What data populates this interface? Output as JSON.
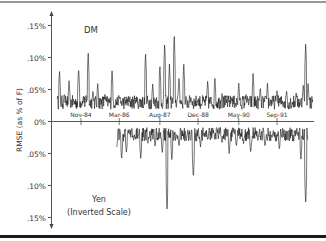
{
  "chart_data": {
    "type": "line",
    "title": "",
    "ylabel": "RMSE (as % of F)",
    "xlabel": "",
    "ylim": [
      -0.15,
      0.15
    ],
    "y_ticks": [
      {
        "value": 0.15,
        "label": ".15%"
      },
      {
        "value": 0.1,
        "label": ".10%"
      },
      {
        "value": 0.05,
        "label": ".05%"
      },
      {
        "value": 0.0,
        "label": "0%"
      },
      {
        "value": -0.05,
        "label": ".05%"
      },
      {
        "value": -0.1,
        "label": ".10%"
      },
      {
        "value": -0.15,
        "label": ".15%"
      }
    ],
    "x_ticks": [
      "Nov-84",
      "Mar-86",
      "Aug-87",
      "Dec-88",
      "May-90",
      "Sep-91"
    ],
    "grid": false,
    "legend": "none",
    "annotations": [
      {
        "text": "DM",
        "position": "upper panel, top-left"
      },
      {
        "text": "Yen",
        "position": "lower panel, bottom-left"
      },
      {
        "text": "(Inverted Scale)",
        "position": "lower panel, below Yen"
      }
    ],
    "series": [
      {
        "name": "DM",
        "scale": "normal",
        "start": "approx Jan-84",
        "end": "approx Dec-92",
        "typical_level": 0.03,
        "points": [
          {
            "x": "Jan-84",
            "y": 0.035
          },
          {
            "x": "Feb-84",
            "y": 0.08
          },
          {
            "x": "Apr-84",
            "y": 0.045
          },
          {
            "x": "Jun-84",
            "y": 0.065
          },
          {
            "x": "Aug-84",
            "y": 0.03
          },
          {
            "x": "Oct-84",
            "y": 0.085
          },
          {
            "x": "Dec-84",
            "y": 0.04
          },
          {
            "x": "Feb-85",
            "y": 0.11
          },
          {
            "x": "Apr-85",
            "y": 0.05
          },
          {
            "x": "Jun-85",
            "y": 0.06
          },
          {
            "x": "Sep-85",
            "y": 0.045
          },
          {
            "x": "Dec-85",
            "y": 0.08
          },
          {
            "x": "Mar-86",
            "y": 0.04
          },
          {
            "x": "Jun-86",
            "y": 0.03
          },
          {
            "x": "Oct-86",
            "y": 0.035
          },
          {
            "x": "Feb-87",
            "y": 0.11
          },
          {
            "x": "May-87",
            "y": 0.06
          },
          {
            "x": "Aug-87",
            "y": 0.09
          },
          {
            "x": "Oct-87",
            "y": 0.125
          },
          {
            "x": "Dec-87",
            "y": 0.09
          },
          {
            "x": "Feb-88",
            "y": 0.14
          },
          {
            "x": "Apr-88",
            "y": 0.07
          },
          {
            "x": "Jun-88",
            "y": 0.09
          },
          {
            "x": "Sep-88",
            "y": 0.04
          },
          {
            "x": "Dec-88",
            "y": 0.035
          },
          {
            "x": "Apr-89",
            "y": 0.065
          },
          {
            "x": "Jul-89",
            "y": 0.07
          },
          {
            "x": "Oct-89",
            "y": 0.045
          },
          {
            "x": "Feb-90",
            "y": 0.04
          },
          {
            "x": "May-90",
            "y": 0.06
          },
          {
            "x": "Aug-90",
            "y": 0.045
          },
          {
            "x": "Nov-90",
            "y": 0.075
          },
          {
            "x": "Feb-91",
            "y": 0.055
          },
          {
            "x": "May-91",
            "y": 0.06
          },
          {
            "x": "Sep-91",
            "y": 0.05
          },
          {
            "x": "Jan-92",
            "y": 0.05
          },
          {
            "x": "May-92",
            "y": 0.045
          },
          {
            "x": "Aug-92",
            "y": 0.06
          },
          {
            "x": "Sep-92",
            "y": 0.125
          },
          {
            "x": "Oct-92",
            "y": 0.06
          },
          {
            "x": "Dec-92",
            "y": 0.035
          }
        ]
      },
      {
        "name": "Yen",
        "scale": "inverted",
        "start": "approx Feb-86",
        "end": "approx Oct-92",
        "typical_level": 0.02,
        "points": [
          {
            "x": "Feb-86",
            "y": 0.04
          },
          {
            "x": "Apr-86",
            "y": 0.06
          },
          {
            "x": "Jun-86",
            "y": 0.05
          },
          {
            "x": "Sep-86",
            "y": 0.03
          },
          {
            "x": "Dec-86",
            "y": 0.06
          },
          {
            "x": "Mar-87",
            "y": 0.035
          },
          {
            "x": "Jun-87",
            "y": 0.04
          },
          {
            "x": "Sep-87",
            "y": 0.05
          },
          {
            "x": "Nov-87",
            "y": 0.145
          },
          {
            "x": "Jan-88",
            "y": 0.06
          },
          {
            "x": "Apr-88",
            "y": 0.04
          },
          {
            "x": "Jul-88",
            "y": 0.03
          },
          {
            "x": "Oct-88",
            "y": 0.09
          },
          {
            "x": "Jan-89",
            "y": 0.04
          },
          {
            "x": "Apr-89",
            "y": 0.03
          },
          {
            "x": "Jul-89",
            "y": 0.025
          },
          {
            "x": "Oct-89",
            "y": 0.035
          },
          {
            "x": "Jan-90",
            "y": 0.05
          },
          {
            "x": "Apr-90",
            "y": 0.04
          },
          {
            "x": "Jul-90",
            "y": 0.035
          },
          {
            "x": "Oct-90",
            "y": 0.05
          },
          {
            "x": "Jan-91",
            "y": 0.03
          },
          {
            "x": "Apr-91",
            "y": 0.04
          },
          {
            "x": "Jul-91",
            "y": 0.025
          },
          {
            "x": "Oct-91",
            "y": 0.045
          },
          {
            "x": "Jan-92",
            "y": 0.01
          },
          {
            "x": "Apr-92",
            "y": 0.02
          },
          {
            "x": "Jul-92",
            "y": 0.06
          },
          {
            "x": "Sep-92",
            "y": 0.135
          },
          {
            "x": "Oct-92",
            "y": 0.03
          }
        ]
      }
    ]
  },
  "labels": {
    "y_axis_title": "RMSE (as % of F)",
    "dm": "DM",
    "yen": "Yen",
    "inverted": "(Inverted Scale)",
    "y_ticks": [
      ".15%",
      ".10%",
      ".05%",
      "0%",
      ".05%",
      ".10%",
      ".15%"
    ],
    "x_ticks": [
      "Nov-84",
      "Mar-86",
      "Aug-87",
      "Dec-88",
      "May-90",
      "Sep-91"
    ]
  },
  "colors": {
    "series": "#1a1a1a",
    "axis": "#555555",
    "border": "#2a2a2a"
  }
}
